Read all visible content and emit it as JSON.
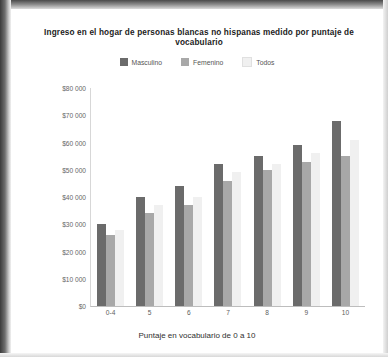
{
  "chart_data": {
    "type": "bar",
    "title": "Ingreso en el hogar de personas blancas no hispanas medido por puntaje de vocabulario",
    "xlabel": "Puntaje en vocabulario de 0 a 10",
    "ylabel": "Ingreso en $",
    "categories": [
      "0-4",
      "5",
      "6",
      "7",
      "8",
      "9",
      "10"
    ],
    "series": [
      {
        "name": "Masculino",
        "color": "#6b6b6b",
        "values": [
          30000,
          40000,
          44000,
          52000,
          55000,
          59000,
          68000
        ]
      },
      {
        "name": "Femenino",
        "color": "#a8a8a8",
        "values": [
          26000,
          34000,
          37000,
          46000,
          50000,
          53000,
          55000
        ]
      },
      {
        "name": "Todos",
        "color": "#f0f0f0",
        "values": [
          28000,
          37000,
          40000,
          49000,
          52000,
          56000,
          61000
        ]
      }
    ],
    "ylim": [
      0,
      80000
    ],
    "yticks": [
      0,
      10000,
      20000,
      30000,
      40000,
      50000,
      60000,
      70000,
      80000
    ],
    "ytick_labels": [
      "$0",
      "$10 000",
      "$20 000",
      "$30 000",
      "$40 000",
      "$50 000",
      "$60 000",
      "$70 000",
      "$80 000"
    ],
    "grid": false,
    "legend_position": "top"
  }
}
